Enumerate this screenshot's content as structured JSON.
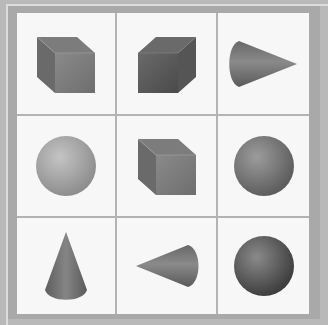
{
  "figure": {
    "type": "3x3 shape grid",
    "rows": 3,
    "columns": 3,
    "colors": {
      "background": "#f7f7f7",
      "grid_line": "#b3b3b3",
      "frame_outer": "#b9b9b9",
      "frame_inner": "#a9a9a9",
      "shape_light": "#9a9a9a",
      "shape_mid": "#707070",
      "shape_dark": "#4a4a4a"
    },
    "cells": [
      {
        "row": 1,
        "col": 1,
        "shape": "cube",
        "orientation": "back-face-upper-left",
        "shade": "medium"
      },
      {
        "row": 1,
        "col": 2,
        "shape": "cube",
        "orientation": "back-face-upper-right",
        "shade": "dark"
      },
      {
        "row": 1,
        "col": 3,
        "shape": "cone",
        "orientation": "pointing-right",
        "shade": "medium"
      },
      {
        "row": 2,
        "col": 1,
        "shape": "sphere",
        "orientation": "none",
        "shade": "light"
      },
      {
        "row": 2,
        "col": 2,
        "shape": "cube",
        "orientation": "back-face-upper-left",
        "shade": "medium"
      },
      {
        "row": 2,
        "col": 3,
        "shape": "sphere",
        "orientation": "none",
        "shade": "medium"
      },
      {
        "row": 3,
        "col": 1,
        "shape": "cone",
        "orientation": "pointing-up",
        "shade": "medium"
      },
      {
        "row": 3,
        "col": 2,
        "shape": "cone",
        "orientation": "pointing-left",
        "shade": "medium"
      },
      {
        "row": 3,
        "col": 3,
        "shape": "sphere",
        "orientation": "none",
        "shade": "dark"
      }
    ]
  }
}
